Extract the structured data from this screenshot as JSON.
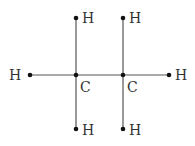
{
  "diagram": {
    "molecule": "ethane",
    "atoms": [
      {
        "id": "h_left",
        "label": "H",
        "x": 30,
        "y": 75
      },
      {
        "id": "c1",
        "label": "C",
        "x": 76,
        "y": 75
      },
      {
        "id": "c2",
        "label": "C",
        "x": 123,
        "y": 75
      },
      {
        "id": "h_right",
        "label": "H",
        "x": 169,
        "y": 75
      },
      {
        "id": "h_c1_top",
        "label": "H",
        "x": 76,
        "y": 18
      },
      {
        "id": "h_c1_bottom",
        "label": "H",
        "x": 76,
        "y": 129
      },
      {
        "id": "h_c2_top",
        "label": "H",
        "x": 123,
        "y": 18
      },
      {
        "id": "h_c2_bottom",
        "label": "H",
        "x": 123,
        "y": 129
      }
    ],
    "bond_color": "#555555",
    "dot_color": "#111111"
  }
}
